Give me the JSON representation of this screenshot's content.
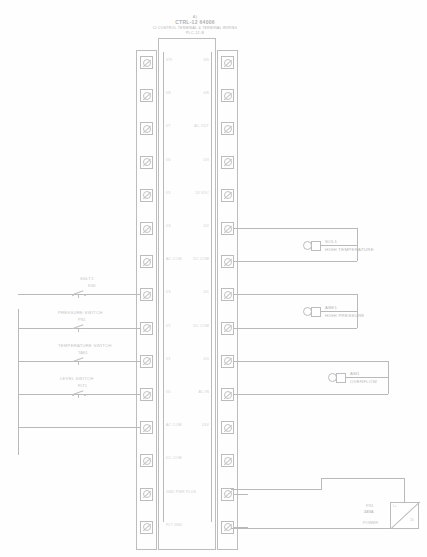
{
  "drawing": {
    "title_line1": "A)",
    "title_line2": "CTRL-12 64006",
    "title_line3": "CI CONTROL TERMINAL & TERMINAL WIRING",
    "title_line4": "PLC-12-B"
  },
  "terminal_strip": {
    "name": "terminal-strip",
    "rows": [
      {
        "left_label": "V/9",
        "right_label": "0/9",
        "left_wire": false,
        "right_wire": false
      },
      {
        "left_label": "I/8",
        "right_label": "0/8",
        "left_wire": false,
        "right_wire": false
      },
      {
        "left_label": "I/7",
        "right_label": "AC OUT",
        "left_wire": false,
        "right_wire": false
      },
      {
        "left_label": "I/6",
        "right_label": "0/3",
        "left_wire": false,
        "right_wire": false
      },
      {
        "left_label": "I/5",
        "right_label": "24 VDC",
        "left_wire": false,
        "right_wire": false
      },
      {
        "left_label": "I/4",
        "right_label": "0/2",
        "left_wire": false,
        "right_wire": true
      },
      {
        "left_label": "AC COM",
        "right_label": "DC COM",
        "left_wire": false,
        "right_wire": true
      },
      {
        "left_label": "I/3",
        "right_label": "0/1",
        "left_wire": true,
        "right_wire": true
      },
      {
        "left_label": "I/2",
        "right_label": "DC COM",
        "left_wire": true,
        "right_wire": true
      },
      {
        "left_label": "I/1",
        "right_label": "0/0",
        "left_wire": true,
        "right_wire": true
      },
      {
        "left_label": "I/0",
        "right_label": "AC IN",
        "left_wire": true,
        "right_wire": true
      },
      {
        "left_label": "AC COM",
        "right_label": "24V",
        "left_wire": true,
        "right_wire": false
      },
      {
        "left_label": "DC COM",
        "right_label": "",
        "left_wire": false,
        "right_wire": false
      },
      {
        "left_label": "GND PWR PLUS",
        "right_label": "",
        "left_wire": false,
        "right_wire": true
      },
      {
        "left_label": "PLT GND",
        "right_label": "",
        "left_wire": false,
        "right_wire": true
      }
    ]
  },
  "inputs": [
    {
      "name": "SSLT1",
      "tag": "KS0",
      "has_name": true
    },
    {
      "name": "PRESSURE SWITCH",
      "tag": "PS1",
      "has_name": true
    },
    {
      "name": "TEMPERATURE SWITCH",
      "tag": "TAS1",
      "has_name": true
    },
    {
      "name": "LEVEL SWITCH",
      "tag": "FLT1",
      "has_name": true
    }
  ],
  "outputs": [
    {
      "tag": "SOL1",
      "desc": "HIGH TEMPERATURE"
    },
    {
      "tag": "ABE1",
      "desc": "HIGH PRESSURE"
    },
    {
      "tag": "AM1",
      "desc": "OVERFLOW"
    }
  ],
  "power_supply": {
    "tag": "PS1",
    "rating": "24VA",
    "label": "POWER",
    "in_marker": "L+",
    "out_marker": "24"
  }
}
